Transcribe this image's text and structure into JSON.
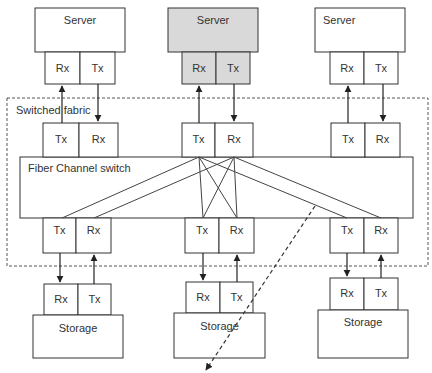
{
  "diagram": {
    "fabric_label": "Switched fabric",
    "switch_label": "Fiber Channel switch",
    "servers": [
      {
        "label": "Server",
        "rx": "Rx",
        "tx": "Tx",
        "fill": "#ffffff"
      },
      {
        "label": "Server",
        "rx": "Rx",
        "tx": "Tx",
        "fill": "#d9d9d9"
      },
      {
        "label": "Server",
        "rx": "Rx",
        "tx": "Tx",
        "fill": "#ffffff"
      }
    ],
    "switch_top_ports": [
      {
        "tx": "Tx",
        "rx": "Rx"
      },
      {
        "tx": "Tx",
        "rx": "Rx"
      },
      {
        "tx": "Tx",
        "rx": "Rx"
      }
    ],
    "switch_bottom_ports": [
      {
        "tx": "Tx",
        "rx": "Rx"
      },
      {
        "tx": "Tx",
        "rx": "Rx"
      },
      {
        "tx": "Tx",
        "rx": "Rx"
      }
    ],
    "storage": [
      {
        "label": "Storage",
        "rx": "Rx",
        "tx": "Tx"
      },
      {
        "label": "Storage",
        "rx": "Rx",
        "tx": "Tx"
      },
      {
        "label": "Storage",
        "rx": "Rx",
        "tx": "Tx"
      }
    ],
    "colors": {
      "line": "#333333",
      "highlight_fill": "#d9d9d9",
      "dashed": "#555555"
    }
  }
}
